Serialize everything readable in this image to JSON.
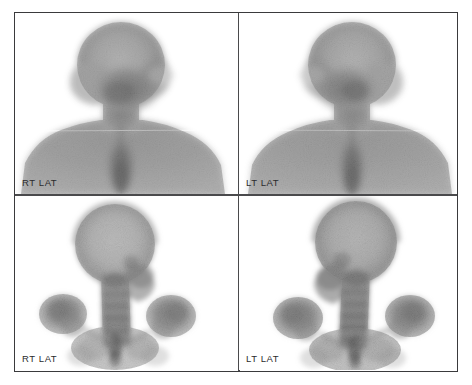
{
  "study": {
    "modality_label": "bone-scintigraphy",
    "background_color": "#ffffff",
    "frame_border_color": "#3a3a3c",
    "divider_color": "#4a4a4c",
    "label_color": "#2b2b2d"
  },
  "panels": [
    {
      "id": "top-left",
      "label": "RT LAT",
      "phase": "blood-pool",
      "view": "right-lateral",
      "mirrored": false,
      "content": "head-neck-shoulders-soft-tissue"
    },
    {
      "id": "top-right",
      "label": "LT LAT",
      "phase": "blood-pool",
      "view": "left-lateral",
      "mirrored": true,
      "content": "head-neck-shoulders-soft-tissue"
    },
    {
      "id": "bottom-left",
      "label": "RT LAT",
      "phase": "delayed-bone",
      "view": "right-lateral",
      "mirrored": false,
      "content": "skull-cervical-spine-shoulders"
    },
    {
      "id": "bottom-right",
      "label": "LT LAT",
      "phase": "delayed-bone",
      "view": "left-lateral",
      "mirrored": true,
      "content": "skull-cervical-spine-shoulders"
    }
  ]
}
